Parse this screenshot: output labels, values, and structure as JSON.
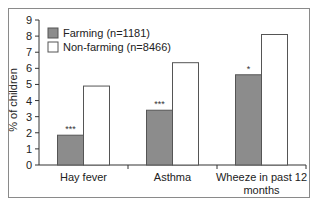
{
  "chart_data": {
    "type": "bar",
    "title": "",
    "xlabel": "",
    "ylabel": "% of children",
    "ylim": [
      0,
      9
    ],
    "yticks": [
      0,
      1,
      2,
      3,
      4,
      5,
      6,
      7,
      8,
      9
    ],
    "grid": false,
    "legend_position": "upper left",
    "categories": [
      "Hay fever",
      "Asthma",
      "Wheeze in past 12 months"
    ],
    "category_label_lines": [
      [
        "Hay fever"
      ],
      [
        "Asthma"
      ],
      [
        "Wheeze in past 12",
        "months"
      ]
    ],
    "series": [
      {
        "name": "Farming (n=1181)",
        "color": "#8c8c8c",
        "values": [
          1.85,
          3.4,
          5.6
        ],
        "significance": [
          "***",
          "***",
          "*"
        ]
      },
      {
        "name": "Non-farming (n=8466)",
        "color": "#ffffff",
        "values": [
          4.9,
          6.35,
          8.1
        ],
        "significance": [
          "",
          "",
          ""
        ]
      }
    ]
  }
}
